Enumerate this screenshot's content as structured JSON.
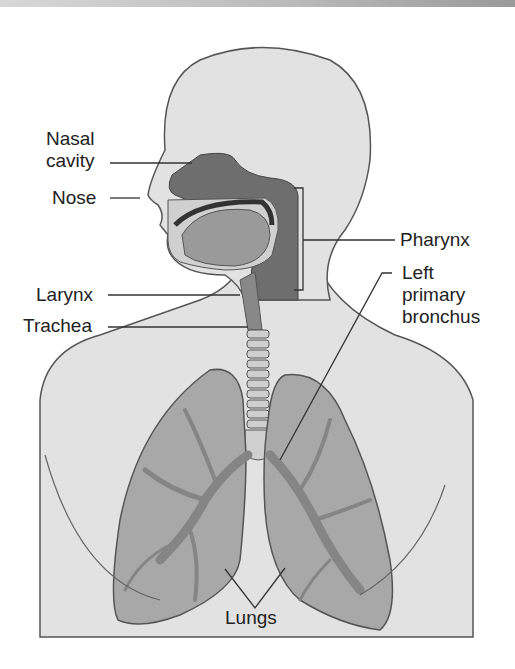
{
  "figure": {
    "colors": {
      "skin": "#e2e2e2",
      "outline": "#555555",
      "airway_dark": "#6e6e6e",
      "lung": "#a8a8a8",
      "bronchi": "#858585",
      "label_text": "#222222"
    }
  },
  "labels": {
    "nasal_cavity_1": "Nasal",
    "nasal_cavity_2": "cavity",
    "nose": "Nose",
    "larynx": "Larynx",
    "trachea": "Trachea",
    "pharynx": "Pharynx",
    "left_primary_bronchus_1": "Left",
    "left_primary_bronchus_2": "primary",
    "left_primary_bronchus_3": "bronchus",
    "lungs": "Lungs"
  }
}
